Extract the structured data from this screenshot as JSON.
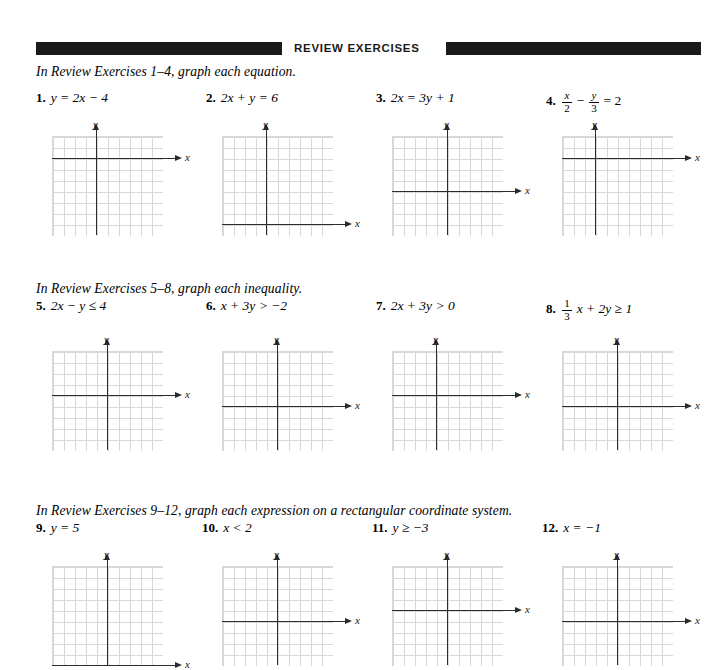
{
  "header": {
    "title": "REVIEW EXERCISES",
    "bar_color": "#1a1a1a"
  },
  "sections": [
    {
      "instruction": "In Review Exercises 1–4, graph each equation.",
      "problems": [
        {
          "number": "1.",
          "equation": "y = 2x − 4",
          "type": "plain"
        },
        {
          "number": "2.",
          "equation": "2x + y = 6",
          "type": "plain"
        },
        {
          "number": "3.",
          "equation": "2x = 3y + 1",
          "type": "plain"
        },
        {
          "number": "4.",
          "equation": "x/2 − y/3 = 2",
          "type": "fraction",
          "parts": {
            "n1": "x",
            "d1": "2",
            "op": "−",
            "n2": "y",
            "d2": "3",
            "tail": "= 2"
          }
        }
      ]
    },
    {
      "instruction": "In Review Exercises 5–8, graph each inequality.",
      "problems": [
        {
          "number": "5.",
          "equation": "2x − y ≤ 4",
          "type": "plain"
        },
        {
          "number": "6.",
          "equation": "x + 3y > −2",
          "type": "plain"
        },
        {
          "number": "7.",
          "equation": "2x + 3y > 0",
          "type": "plain"
        },
        {
          "number": "8.",
          "equation": "1/3 x + 2y ≥ 1",
          "type": "fraction",
          "parts": {
            "n1": "1",
            "d1": "3",
            "tail": "x + 2y ≥ 1"
          }
        }
      ]
    },
    {
      "instruction": "In Review Exercises 9–12, graph each expression on a rectangular coordinate system.",
      "problems": [
        {
          "number": "9.",
          "equation": "y = 5",
          "type": "plain"
        },
        {
          "number": "10.",
          "equation": "x < 2",
          "type": "plain"
        },
        {
          "number": "11.",
          "equation": "y ≥ −3",
          "type": "plain"
        },
        {
          "number": "12.",
          "equation": "x = −1",
          "type": "plain"
        }
      ]
    }
  ],
  "graphs": {
    "x_axis_label": "x",
    "y_axis_label": "y",
    "grid_color": "#d8d8d8",
    "axis_color": "#2b2b2b",
    "cell_px": 11,
    "cols": 10,
    "rows": 9,
    "items": [
      {
        "id": "graph-1",
        "origin_col": 4,
        "origin_row": 2
      },
      {
        "id": "graph-2",
        "origin_col": 4,
        "origin_row": 8
      },
      {
        "id": "graph-3",
        "origin_col": 5,
        "origin_row": 5
      },
      {
        "id": "graph-4",
        "origin_col": 3,
        "origin_row": 2
      },
      {
        "id": "graph-5",
        "origin_col": 5,
        "origin_row": 4
      },
      {
        "id": "graph-6",
        "origin_col": 5,
        "origin_row": 5
      },
      {
        "id": "graph-7",
        "origin_col": 4,
        "origin_row": 4
      },
      {
        "id": "graph-8",
        "origin_col": 5,
        "origin_row": 5
      },
      {
        "id": "graph-9",
        "origin_col": 5,
        "origin_row": 9
      },
      {
        "id": "graph-10",
        "origin_col": 5,
        "origin_row": 5
      },
      {
        "id": "graph-11",
        "origin_col": 5,
        "origin_row": 4
      },
      {
        "id": "graph-12",
        "origin_col": 5,
        "origin_row": 5
      }
    ]
  },
  "layout": {
    "column_x": [
      52,
      222,
      392,
      562
    ],
    "problem_x": [
      36,
      206,
      376,
      546
    ]
  }
}
